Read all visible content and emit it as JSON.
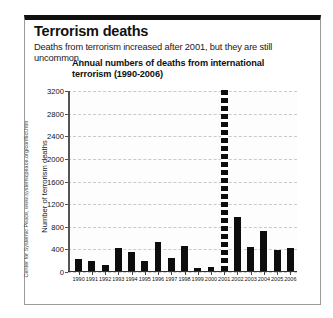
{
  "header": {
    "title": "Terrorism deaths",
    "subtitle": "Deaths from terrorism increased after 2001, but they are still uncommon."
  },
  "credit": "Center for Systemic Peace, www.systemicpeace.org/conflict.htm",
  "chart_data": {
    "type": "bar",
    "title": "Annual numbers of deaths from international terrorism (1990-2006)",
    "xlabel": "",
    "ylabel": "Number of terrorism deaths",
    "ylim": [
      0,
      3200
    ],
    "yticks": [
      0,
      400,
      800,
      1200,
      1600,
      2000,
      2400,
      2800,
      3200
    ],
    "grid": true,
    "legend": "none",
    "categories": [
      "1990",
      "1991",
      "1992",
      "1993",
      "1994",
      "1995",
      "1996",
      "1997",
      "1998",
      "1999",
      "2000",
      "2001",
      "2002",
      "2003",
      "2004",
      "2005",
      "2006"
    ],
    "values": [
      200,
      160,
      100,
      400,
      320,
      170,
      500,
      230,
      430,
      40,
      60,
      3200,
      950,
      420,
      700,
      360,
      400
    ],
    "annotations": [
      "The 2001 bar is drawn as a broken/dashed column indicating the value exceeds the 3200 axis maximum."
    ]
  }
}
